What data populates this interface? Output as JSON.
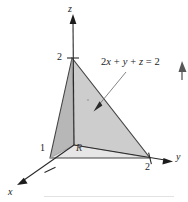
{
  "figure": {
    "kind": "3d-coordinate-diagram",
    "axes": {
      "x_label": "x",
      "y_label": "y",
      "z_label": "z"
    },
    "ticks": {
      "x_intercept": "1",
      "y_intercept": "2",
      "z_intercept": "2"
    },
    "region_label": "R",
    "plane_equation": "2x + y + z = 2",
    "plane_equation_parts": {
      "coef_x": "2",
      "var_x": "x",
      "plus_1": "+",
      "var_y": "y",
      "plus_2": "+",
      "var_z": "z",
      "equals": "=",
      "rhs": "2"
    },
    "colors": {
      "front_face": "#b9b9b9",
      "right_face": "#cfcfcf",
      "base_face": "#e4e4e4",
      "outline": "#3d3d3d",
      "axis": "#2a2a2a",
      "leader": "#6b6b6b",
      "background": "#ffffff"
    },
    "geometry": {
      "origin_px": [
        74,
        145
      ],
      "x_vertex_px": [
        50,
        158
      ],
      "y_vertex_px": [
        150,
        158
      ],
      "z_vertex_px": [
        72,
        58
      ]
    }
  }
}
